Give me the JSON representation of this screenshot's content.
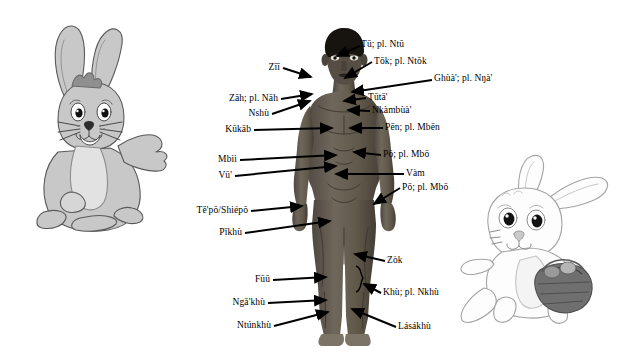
{
  "page": {
    "background_color": "#ffffff",
    "width": 632,
    "height": 355
  },
  "figures": {
    "human": {
      "name": "human-body-front-view",
      "description": "Dark-skinned standing human figure, front view, arms slightly away from body",
      "skin_color": "#6b6358",
      "hair_color": "#1a1613"
    },
    "rabbit_left": {
      "name": "grey-rabbit-waving",
      "description": "Grey cartoon rabbit sitting, one paw raised waving",
      "fill_color": "#c9c9c9",
      "outline_color": "#555555"
    },
    "rabbit_right": {
      "name": "white-rabbit-running-with-basket",
      "description": "White cartoon rabbit running while carrying a basket of eggs",
      "fill_color": "#fdfdfd",
      "outline_color": "#9a9a9a",
      "basket_color": "#6e6e6e"
    }
  },
  "labels": {
    "left": [
      {
        "id": "zii",
        "text": "Zīī",
        "target": "eye"
      },
      {
        "id": "zah",
        "text": "Zāh; pl. Nāh",
        "target": "nose"
      },
      {
        "id": "nshu",
        "text": "Nshù",
        "target": "mouth"
      },
      {
        "id": "kukab",
        "text": "Kūkāb",
        "target": "chest"
      },
      {
        "id": "mbii",
        "text": "Mbìì",
        "target": "forearm"
      },
      {
        "id": "vu",
        "text": "Vū'",
        "target": "wrist"
      },
      {
        "id": "tepo-shiepo",
        "text": "Tě'pō/Shiépō",
        "target": "hand"
      },
      {
        "id": "pikhu",
        "text": "Pǐkhù",
        "target": "thigh"
      },
      {
        "id": "fuu",
        "text": "Fūū",
        "target": "shin"
      },
      {
        "id": "ngakhu",
        "text": "Ngǎ'khù",
        "target": "ankle"
      },
      {
        "id": "ntunkhu",
        "text": "Ntúnkhù",
        "target": "foot"
      }
    ],
    "right": [
      {
        "id": "tu",
        "text": "Tū; pl. Ntū",
        "target": "head-hair"
      },
      {
        "id": "tok",
        "text": "Tōk; pl. Ntōk",
        "target": "ear"
      },
      {
        "id": "ghua",
        "text": "Ghùà'; pl. Nŋà'",
        "target": "cheek-jaw"
      },
      {
        "id": "tuta",
        "text": "Tūtā'",
        "target": "neck"
      },
      {
        "id": "nkambua",
        "text": "Nkàmbùà'",
        "target": "shoulder"
      },
      {
        "id": "pen",
        "text": "Pēn; pl. Mbēn",
        "target": "upper-arm"
      },
      {
        "id": "po-1",
        "text": "Pō; pl. Mbō",
        "target": "arm"
      },
      {
        "id": "vam",
        "text": "Vàm",
        "target": "belly"
      },
      {
        "id": "po-2",
        "text": "Pō; pl. Mbō",
        "target": "hand"
      },
      {
        "id": "zok",
        "text": "Zòk",
        "target": "knee"
      },
      {
        "id": "khu",
        "text": "Khù; pl. Nkhù",
        "target": "leg"
      },
      {
        "id": "lasakhu",
        "text": "Lásákhù",
        "target": "foot-sole"
      }
    ]
  }
}
